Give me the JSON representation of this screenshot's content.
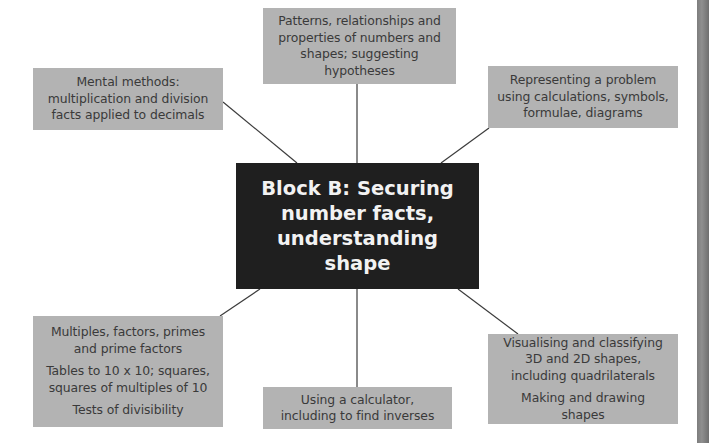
{
  "diagram": {
    "type": "mind-map",
    "center": {
      "text": "Block B: Securing number facts, understanding shape"
    },
    "nodes": {
      "top": {
        "paragraphs": [
          "Patterns, relationships and properties of numbers and shapes; suggesting hypotheses"
        ]
      },
      "top_left": {
        "paragraphs": [
          "Mental methods: multiplication and division facts applied to decimals"
        ]
      },
      "top_right": {
        "paragraphs": [
          "Representing a problem using calculations, symbols, formulae, diagrams"
        ]
      },
      "bottom_left": {
        "paragraphs": [
          "Multiples, factors, primes and prime factors",
          "Tables to 10 x 10; squares, squares of multiples of 10",
          "Tests of divisibility"
        ]
      },
      "bottom": {
        "paragraphs": [
          "Using a calculator, including to find inverses"
        ]
      },
      "bottom_right": {
        "paragraphs": [
          "Visualising and classifying 3D and 2D shapes, including quadrilaterals",
          "Making and drawing shapes"
        ]
      }
    },
    "colors": {
      "node_fill": "#b3b3b3",
      "node_text": "#3a3a3a",
      "center_fill": "#1f1f1f",
      "center_text": "#f2f2f2",
      "connector": "#3c3c3c"
    }
  }
}
